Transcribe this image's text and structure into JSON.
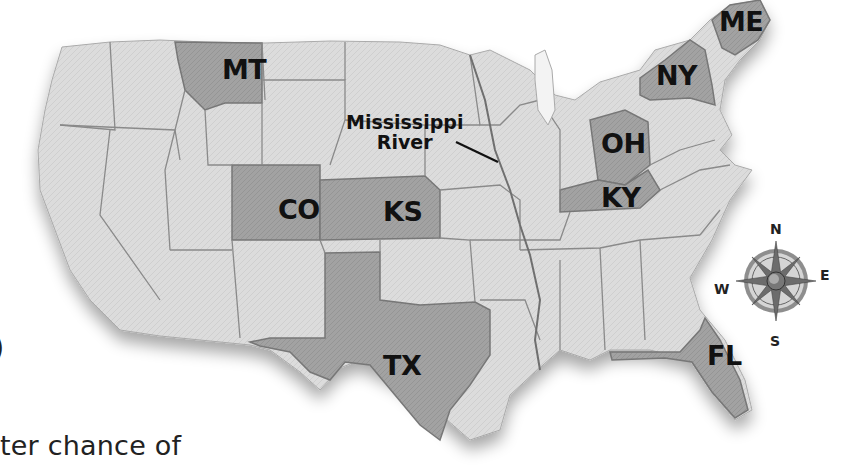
{
  "map": {
    "title": "United States map",
    "state_labels": [
      {
        "id": "MT",
        "label": "MT",
        "x": 222,
        "y": 56
      },
      {
        "id": "CO",
        "label": "CO",
        "x": 278,
        "y": 196
      },
      {
        "id": "KS",
        "label": "KS",
        "x": 383,
        "y": 198
      },
      {
        "id": "TX",
        "label": "TX",
        "x": 383,
        "y": 352
      },
      {
        "id": "OH",
        "label": "OH",
        "x": 601,
        "y": 130
      },
      {
        "id": "KY",
        "label": "KY",
        "x": 601,
        "y": 184
      },
      {
        "id": "NY",
        "label": "NY",
        "x": 656,
        "y": 62
      },
      {
        "id": "ME",
        "label": "ME",
        "x": 719,
        "y": 8
      },
      {
        "id": "FL",
        "label": "FL",
        "x": 707,
        "y": 342
      }
    ],
    "river_label": {
      "line1": "Mississippi",
      "line2": "River"
    },
    "compass": {
      "n": "N",
      "e": "E",
      "s": "S",
      "w": "W"
    },
    "colors": {
      "land": "#dedede",
      "highlight_state": "#9a9a9a",
      "border": "#7a7a7a",
      "label": "#111111"
    }
  },
  "text": {
    "edge_glyph": ")",
    "body_fragment": "ter chance of"
  }
}
